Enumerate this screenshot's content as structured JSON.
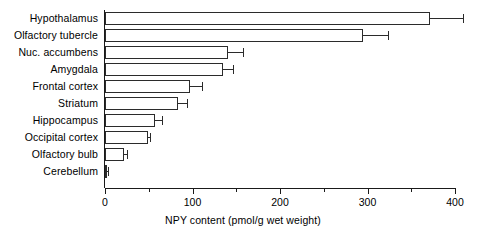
{
  "chart_data": {
    "type": "bar",
    "orientation": "horizontal",
    "title": "",
    "xlabel": "NPY content (pmol/g wet weight)",
    "ylabel": "",
    "xlim": [
      0,
      400
    ],
    "xticks": [
      0,
      100,
      200,
      300,
      400
    ],
    "xticklabels": [
      "0",
      "100",
      "200",
      "300",
      "400"
    ],
    "xminorticks": [
      50,
      150,
      250,
      350
    ],
    "grid": false,
    "legend": null,
    "categories": [
      "Hypothalamus",
      "Olfactory tubercle",
      "Nuc. accumbens",
      "Amygdala",
      "Frontal cortex",
      "Striatum",
      "Hippocampus",
      "Occipital cortex",
      "Olfactory bulb",
      "Cerebellum"
    ],
    "values": [
      371,
      295,
      141,
      135,
      97,
      83,
      57,
      49,
      22,
      2
    ],
    "errors": [
      38,
      28,
      17,
      11,
      14,
      11,
      8,
      2,
      3,
      1
    ],
    "bars": [
      {
        "label": "Hypothalamus",
        "value": 371,
        "error": 38
      },
      {
        "label": "Olfactory tubercle",
        "value": 295,
        "error": 28
      },
      {
        "label": "Nuc. accumbens",
        "value": 141,
        "error": 17
      },
      {
        "label": "Amygdala",
        "value": 135,
        "error": 11
      },
      {
        "label": "Frontal cortex",
        "value": 97,
        "error": 14
      },
      {
        "label": "Striatum",
        "value": 83,
        "error": 11
      },
      {
        "label": "Hippocampus",
        "value": 57,
        "error": 8
      },
      {
        "label": "Occipital cortex",
        "value": 49,
        "error": 2
      },
      {
        "label": "Olfactory bulb",
        "value": 22,
        "error": 3
      },
      {
        "label": "Cerebellum",
        "value": 2,
        "error": 1
      }
    ],
    "colors": {
      "bar_fill": "#ffffff",
      "bar_edge": "#2b2b2b",
      "axis": "#1a1a1a",
      "background": "#ffffff",
      "text": "#000000"
    }
  }
}
